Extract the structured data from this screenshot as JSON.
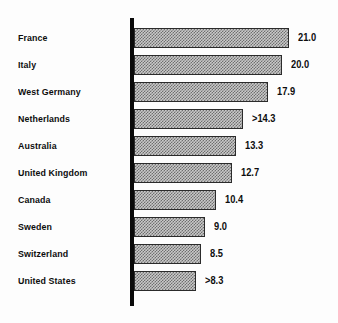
{
  "chart_data": {
    "type": "bar",
    "orientation": "horizontal",
    "title": "",
    "subtitle": "",
    "xlabel": "",
    "ylabel": "",
    "grid": false,
    "legend": false,
    "axis": {
      "value_axis_min": 0,
      "value_axis_max": 21.0,
      "category_axis_line": true,
      "ticks": []
    },
    "categories": [
      "France",
      "Italy",
      "West Germany",
      "Netherlands",
      "Australia",
      "United Kingdom",
      "Canada",
      "Sweden",
      "Switzerland",
      "United States"
    ],
    "values": [
      21.0,
      20.0,
      17.9,
      14.3,
      13.3,
      12.7,
      10.4,
      9.0,
      8.5,
      8.3
    ],
    "value_labels": [
      "21.0",
      "20.0",
      "17.9",
      ">14.3",
      "13.3",
      "12.7",
      "10.4",
      "9.0",
      "8.5",
      ">8.3"
    ],
    "colors": {
      "background": "#fdfdfd",
      "bar_fill": "#c9c9c9",
      "bar_pattern": "#6e6e6e",
      "bar_border": "#2b2b2b",
      "axis": "#0a0a0a",
      "text": "#0d0d0d"
    }
  },
  "rows": [
    {
      "label": "France",
      "value": 21.0,
      "value_label": "21.0",
      "bar_px": 155
    },
    {
      "label": "Italy",
      "value": 20.0,
      "value_label": "20.0",
      "bar_px": 148
    },
    {
      "label": "West Germany",
      "value": 17.9,
      "value_label": "17.9",
      "bar_px": 134
    },
    {
      "label": "Netherlands",
      "value": 14.3,
      "value_label": ">14.3",
      "bar_px": 109
    },
    {
      "label": "Australia",
      "value": 13.3,
      "value_label": "13.3",
      "bar_px": 102
    },
    {
      "label": "United Kingdom",
      "value": 12.7,
      "value_label": "12.7",
      "bar_px": 98
    },
    {
      "label": "Canada",
      "value": 10.4,
      "value_label": "10.4",
      "bar_px": 82
    },
    {
      "label": "Sweden",
      "value": 9.0,
      "value_label": "9.0",
      "bar_px": 71
    },
    {
      "label": "Switzerland",
      "value": 8.5,
      "value_label": "8.5",
      "bar_px": 67
    },
    {
      "label": "United States",
      "value": 8.3,
      "value_label": ">8.3",
      "bar_px": 62
    }
  ]
}
